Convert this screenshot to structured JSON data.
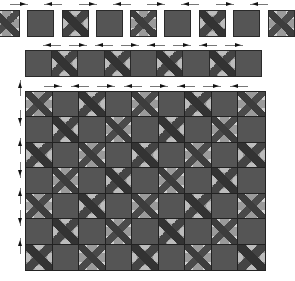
{
  "diagram": {
    "colors": {
      "plain_tile": "#555555",
      "pattern_dark": "#3d3d3d",
      "pattern_mid": "#9a9a9a",
      "pattern_light": "#d6d6d6",
      "border": "#2a2a2a",
      "arrow": "#111111"
    },
    "row1_separate_tiles": {
      "count": 9,
      "tiles": [
        "patterned",
        "plain",
        "patterned",
        "plain",
        "patterned",
        "plain",
        "patterned",
        "plain",
        "patterned"
      ],
      "arrows": [
        "right",
        "left",
        "right",
        "left",
        "right",
        "left",
        "right",
        "left"
      ]
    },
    "row2_strip": {
      "count": 9,
      "cells": [
        "plain",
        "patterned",
        "plain",
        "patterned",
        "plain",
        "patterned",
        "plain",
        "patterned",
        "plain"
      ],
      "arrows": [
        "left",
        "right",
        "left",
        "right",
        "left",
        "right",
        "left",
        "right"
      ]
    },
    "row3_grid": {
      "columns": 9,
      "rows": 7,
      "first_cell": "patterned",
      "layout": "checkerboard",
      "top_arrows": [
        "right",
        "left",
        "right",
        "left",
        "right",
        "left",
        "right",
        "left"
      ],
      "side_arrows": [
        "up",
        "down",
        "up",
        "down",
        "up",
        "down",
        "up"
      ]
    }
  }
}
